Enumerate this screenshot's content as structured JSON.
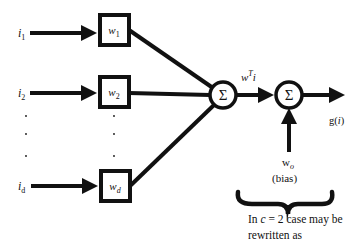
{
  "diagram": {
    "type": "linear-discriminant-unit",
    "inputs": [
      {
        "label": "i",
        "sub": "1"
      },
      {
        "label": "i",
        "sub": "2"
      },
      {
        "label": "i",
        "sub": "d"
      }
    ],
    "weights": [
      {
        "label": "w",
        "sub": "1"
      },
      {
        "label": "w",
        "sub": "2"
      },
      {
        "label": "w",
        "sub": "d"
      }
    ],
    "ellipsis": "·",
    "summation_symbol": "Σ",
    "intermediate_label": {
      "base": "w",
      "sup": "T",
      "tail": "i"
    },
    "output_label": {
      "base": "g(",
      "arg": "i",
      "close": ")"
    },
    "bias": {
      "base": "w",
      "sub": "o",
      "note": "(bias)"
    },
    "caption": {
      "line1_pre": "In ",
      "line1_var": "c",
      "line1_mid": " = ",
      "line1_val": "2",
      "line1_post": " case may be",
      "line2": "rewritten as"
    },
    "colors": {
      "stroke": "#111111",
      "background": "#ffffff"
    }
  }
}
